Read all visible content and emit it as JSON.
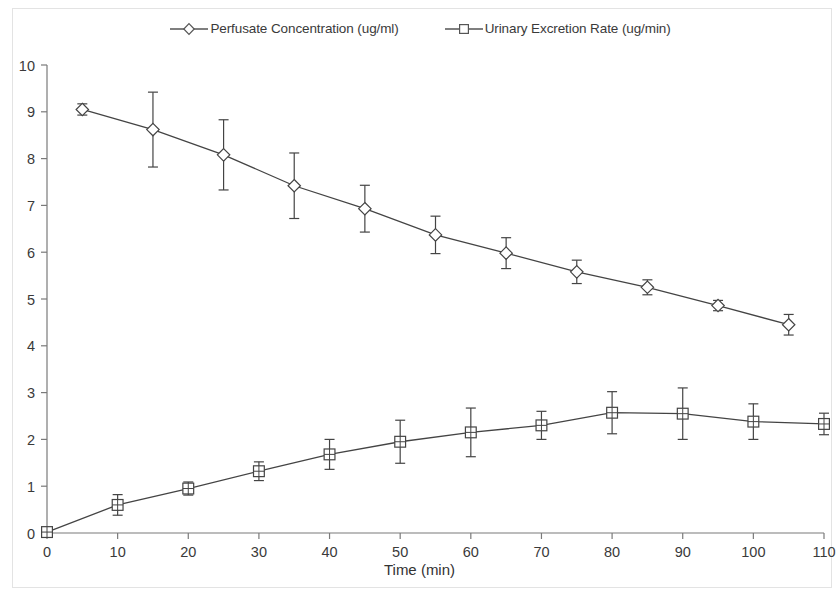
{
  "chart_data": {
    "type": "line",
    "title": "",
    "xlabel": "Time (min)",
    "ylabel": "",
    "xlim": [
      0,
      110
    ],
    "ylim": [
      0,
      10
    ],
    "xticks": [
      0,
      10,
      20,
      30,
      40,
      50,
      60,
      70,
      80,
      90,
      100,
      110
    ],
    "yticks": [
      0,
      1,
      2,
      3,
      4,
      5,
      6,
      7,
      8,
      9,
      10
    ],
    "grid": false,
    "legend_position": "top-center",
    "error_bars": "symmetric",
    "series": [
      {
        "name": "Perfusate Concentration (ug/ml)",
        "marker": "diamond",
        "color": "#444444",
        "x": [
          5,
          15,
          25,
          35,
          45,
          55,
          65,
          75,
          85,
          95,
          105
        ],
        "values": [
          9.05,
          8.62,
          8.08,
          7.42,
          6.93,
          6.37,
          5.98,
          5.58,
          5.25,
          4.86,
          4.45
        ],
        "errors": [
          0.12,
          0.8,
          0.75,
          0.7,
          0.5,
          0.4,
          0.33,
          0.25,
          0.16,
          0.11,
          0.22
        ]
      },
      {
        "name": "Urinary Excretion Rate (ug/min)",
        "marker": "square",
        "color": "#444444",
        "x": [
          0,
          10,
          20,
          30,
          40,
          50,
          60,
          70,
          80,
          90,
          100,
          110
        ],
        "values": [
          0.02,
          0.6,
          0.95,
          1.32,
          1.68,
          1.95,
          2.15,
          2.3,
          2.57,
          2.55,
          2.38,
          2.33
        ],
        "errors": [
          0.02,
          0.22,
          0.14,
          0.2,
          0.32,
          0.46,
          0.52,
          0.3,
          0.45,
          0.55,
          0.38,
          0.23
        ]
      }
    ]
  },
  "legend": {
    "entries": [
      {
        "label": "Perfusate Concentration (ug/ml)",
        "marker": "diamond"
      },
      {
        "label": "Urinary Excretion Rate (ug/min)",
        "marker": "square"
      }
    ]
  },
  "axes": {
    "x_title": "Time (min)"
  }
}
